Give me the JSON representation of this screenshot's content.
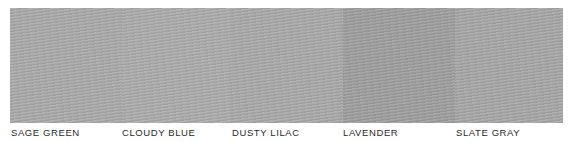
{
  "swatches": [
    {
      "name": "SAGE GREEN",
      "color": "#a9a9a9",
      "width": 112,
      "label_x": 11
    },
    {
      "name": "CLOUDY BLUE",
      "color": "#ababab",
      "width": 108,
      "label_x": 122
    },
    {
      "name": "DUSTY LILAC",
      "color": "#a8a8a8",
      "width": 113,
      "label_x": 232
    },
    {
      "name": "LAVENDER",
      "color": "#9e9e9e",
      "width": 112,
      "label_x": 343
    },
    {
      "name": "SLATE GRAY",
      "color": "#a6a6a6",
      "width": 108,
      "label_x": 456
    }
  ]
}
